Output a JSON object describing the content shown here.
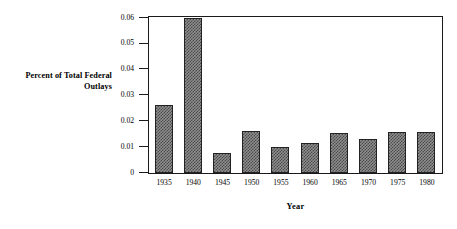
{
  "chart_data": {
    "type": "bar",
    "title": "",
    "xlabel": "Year",
    "ylabel": "Percent of Total Federal Outlays",
    "categories": [
      "1935",
      "1940",
      "1945",
      "1950",
      "1955",
      "1960",
      "1965",
      "1970",
      "1975",
      "1980"
    ],
    "values": [
      0.0263,
      0.06,
      0.0076,
      0.0164,
      0.0099,
      0.0117,
      0.0154,
      0.0133,
      0.0158,
      0.0158
    ],
    "ylim": [
      0,
      0.06
    ],
    "yticks": [
      0,
      0.01,
      0.02,
      0.03,
      0.04,
      0.05,
      0.06
    ],
    "ytick_labels": [
      "0",
      "0.01",
      "0.02",
      "0.03",
      "0.04",
      "0.05",
      "0.06"
    ],
    "grid": false,
    "legend": null,
    "series": [
      {
        "name": "Percent of Total Federal Outlays",
        "values": [
          0.0263,
          0.06,
          0.0076,
          0.0164,
          0.0099,
          0.0117,
          0.0154,
          0.0133,
          0.0158,
          0.0158
        ]
      }
    ],
    "bar_fill": "#8e8e8e",
    "bar_edge": "#222222",
    "axis_color": "#1a1a1a"
  },
  "axes": {
    "y_title": "Percent of Total Federal\nOutlays",
    "y_title_line1": "Percent of Total Federal",
    "y_title_line2": "Outlays",
    "x_title": "Year"
  }
}
